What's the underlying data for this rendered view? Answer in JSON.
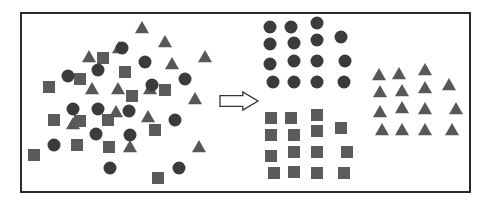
{
  "figure": {
    "colors": {
      "frame": "#2a2a2a",
      "circle": "#3b3b3b",
      "square": "#5b5b5b",
      "triangle": "#575757",
      "arrow_fill": "#ffffff",
      "arrow_stroke": "#333333"
    },
    "arrow": {
      "icon": "right-arrow-icon",
      "x": 220,
      "y": 92,
      "w": 38,
      "h": 18
    },
    "mixed": {
      "circles": [
        [
          122,
          48
        ],
        [
          145,
          62
        ],
        [
          98,
          70
        ],
        [
          68,
          76
        ],
        [
          185,
          79
        ],
        [
          152,
          85
        ],
        [
          73,
          109
        ],
        [
          98,
          109
        ],
        [
          129,
          111
        ],
        [
          175,
          120
        ],
        [
          96,
          134
        ],
        [
          130,
          135
        ],
        [
          54,
          145
        ],
        [
          110,
          168
        ],
        [
          179,
          168
        ]
      ],
      "squares": [
        [
          103,
          58
        ],
        [
          125,
          72
        ],
        [
          80,
          79
        ],
        [
          49,
          87
        ],
        [
          165,
          90
        ],
        [
          132,
          96
        ],
        [
          54,
          120
        ],
        [
          80,
          121
        ],
        [
          108,
          120
        ],
        [
          155,
          130
        ],
        [
          77,
          145
        ],
        [
          109,
          147
        ],
        [
          34,
          155
        ],
        [
          158,
          178
        ]
      ],
      "triangles": [
        [
          142,
          28
        ],
        [
          165,
          42
        ],
        [
          119,
          48
        ],
        [
          89,
          57
        ],
        [
          172,
          64
        ],
        [
          205,
          57
        ],
        [
          92,
          89
        ],
        [
          118,
          89
        ],
        [
          150,
          89
        ],
        [
          195,
          99
        ],
        [
          116,
          112
        ],
        [
          73,
          124
        ],
        [
          148,
          117
        ],
        [
          130,
          147
        ],
        [
          199,
          147
        ]
      ]
    },
    "clusters": {
      "circles": [
        [
          270,
          27
        ],
        [
          291,
          27
        ],
        [
          317,
          23
        ],
        [
          270,
          44
        ],
        [
          294,
          43
        ],
        [
          317,
          40
        ],
        [
          341,
          37
        ],
        [
          270,
          64
        ],
        [
          294,
          61
        ],
        [
          317,
          61
        ],
        [
          345,
          61
        ],
        [
          273,
          82
        ],
        [
          294,
          82
        ],
        [
          317,
          82
        ],
        [
          344,
          82
        ]
      ],
      "squares": [
        [
          271,
          118
        ],
        [
          291,
          118
        ],
        [
          317,
          115
        ],
        [
          271,
          135
        ],
        [
          294,
          135
        ],
        [
          317,
          131
        ],
        [
          341,
          128
        ],
        [
          271,
          156
        ],
        [
          294,
          152
        ],
        [
          317,
          152
        ],
        [
          347,
          152
        ],
        [
          274,
          173
        ],
        [
          294,
          172
        ],
        [
          317,
          173
        ],
        [
          344,
          173
        ]
      ],
      "triangles": [
        [
          379,
          75
        ],
        [
          399,
          74
        ],
        [
          425,
          70
        ],
        [
          380,
          92
        ],
        [
          402,
          91
        ],
        [
          425,
          88
        ],
        [
          449,
          85
        ],
        [
          380,
          112
        ],
        [
          402,
          108
        ],
        [
          425,
          109
        ],
        [
          456,
          109
        ],
        [
          382,
          130
        ],
        [
          402,
          130
        ],
        [
          425,
          130
        ],
        [
          452,
          130
        ]
      ]
    },
    "sizes": {
      "circle_r": 6.5,
      "square": 12,
      "triangle": 14
    }
  }
}
